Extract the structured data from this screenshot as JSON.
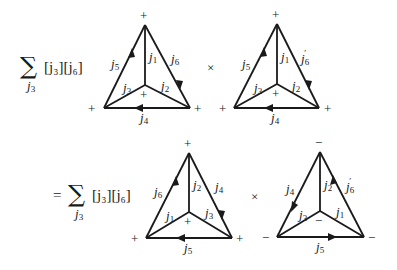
{
  "rows": [
    {
      "prefix": "",
      "sum_symbol": "∑",
      "sum_index": "j",
      "sum_index_sub": "3",
      "factor": "[j₃][j₆]",
      "times": "×",
      "diagrams": [
        {
          "vertex_signs": {
            "top": "+",
            "left": "+",
            "right": "+",
            "center": "+"
          },
          "edges": {
            "left": {
              "label": "j",
              "sub": "5",
              "prime": false,
              "arrow": "up"
            },
            "right": {
              "label": "j",
              "sub": "6",
              "prime": false,
              "arrow": "down"
            },
            "center_vertical": {
              "label": "j",
              "sub": "1"
            },
            "center_left": {
              "label": "j",
              "sub": "3"
            },
            "center_right": {
              "label": "j",
              "sub": "2"
            },
            "bottom": {
              "label": "j",
              "sub": "4",
              "arrow": "left"
            }
          }
        },
        {
          "vertex_signs": {
            "top": "+",
            "left": "+",
            "right": "+",
            "center": "+"
          },
          "edges": {
            "left": {
              "label": "j",
              "sub": "5",
              "prime": false,
              "arrow": "up"
            },
            "right": {
              "label": "j",
              "sub": "6",
              "prime": true,
              "arrow": "down"
            },
            "center_vertical": {
              "label": "j",
              "sub": "1"
            },
            "center_left": {
              "label": "j",
              "sub": "3"
            },
            "center_right": {
              "label": "j",
              "sub": "2"
            },
            "bottom": {
              "label": "j",
              "sub": "4",
              "arrow": "left"
            }
          }
        }
      ]
    },
    {
      "prefix": "=",
      "sum_symbol": "∑",
      "sum_index": "j",
      "sum_index_sub": "3",
      "factor": "[j₃][j₆]",
      "times": "×",
      "diagrams": [
        {
          "vertex_signs": {
            "top": "+",
            "left": "+",
            "right": "+",
            "center": "+"
          },
          "edges": {
            "left": {
              "label": "j",
              "sub": "6",
              "prime": false,
              "arrow": "up"
            },
            "right": {
              "label": "j",
              "sub": "4",
              "prime": false,
              "arrow": "down"
            },
            "center_vertical": {
              "label": "j",
              "sub": "2"
            },
            "center_left": {
              "label": "j",
              "sub": "1"
            },
            "center_right": {
              "label": "j",
              "sub": "3"
            },
            "bottom": {
              "label": "j",
              "sub": "5",
              "arrow": "left"
            }
          }
        },
        {
          "vertex_signs": {
            "top": "−",
            "left": "−",
            "right": "−",
            "center": "−"
          },
          "edges": {
            "left": {
              "label": "j",
              "sub": "4",
              "prime": false,
              "arrow": "down"
            },
            "right": {
              "label": "j",
              "sub": "6",
              "prime": true,
              "arrow": "up"
            },
            "center_vertical": {
              "label": "j",
              "sub": "2"
            },
            "center_left": {
              "label": "j",
              "sub": "3"
            },
            "center_right": {
              "label": "j",
              "sub": "1"
            },
            "bottom": {
              "label": "j",
              "sub": "5",
              "arrow": "right"
            }
          }
        }
      ]
    }
  ]
}
